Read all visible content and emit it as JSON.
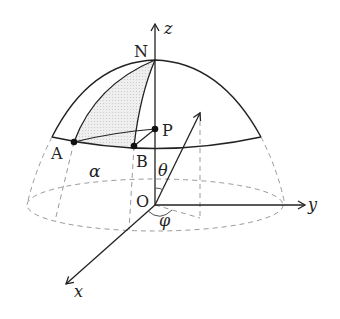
{
  "diagram": {
    "labels": {
      "z_axis": "z",
      "y_axis": "y",
      "x_axis": "x",
      "north": "N",
      "point_p": "P",
      "point_a": "A",
      "point_b": "B",
      "origin": "O",
      "alpha": "α",
      "theta": "θ",
      "phi": "φ"
    },
    "colors": {
      "stroke": "#222222",
      "dashed": "#9a9a9a",
      "shade": "#e6e6e6"
    }
  }
}
